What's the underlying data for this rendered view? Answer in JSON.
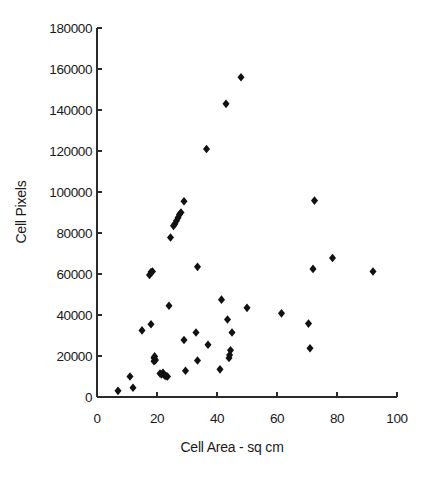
{
  "chart_data": {
    "type": "scatter",
    "title": "",
    "xlabel": "Cell Area - sq cm",
    "ylabel": "Cell Pixels",
    "xlim": [
      0,
      100
    ],
    "ylim": [
      0,
      180000
    ],
    "xticks": [
      0,
      20,
      40,
      60,
      80,
      100
    ],
    "xtick_labels": [
      "0",
      "20",
      "40",
      "60",
      "80",
      "100"
    ],
    "yticks": [
      0,
      20000,
      40000,
      60000,
      80000,
      100000,
      120000,
      140000,
      160000,
      180000
    ],
    "ytick_labels": [
      "0",
      "20000",
      "40000",
      "60000",
      "80000",
      "100000",
      "120000",
      "140000",
      "160000",
      "180000"
    ],
    "grid": false,
    "legend": false,
    "marker": "diamond",
    "marker_color": "#111111",
    "series": [
      {
        "name": "Cell Pixels vs Cell Area",
        "points": [
          [
            7,
            3000
          ],
          [
            11,
            10000
          ],
          [
            12,
            4500
          ],
          [
            15,
            32500
          ],
          [
            17.5,
            59500
          ],
          [
            18,
            61000
          ],
          [
            18.5,
            61200
          ],
          [
            18,
            35500
          ],
          [
            19,
            17500
          ],
          [
            19,
            19000
          ],
          [
            19.2,
            19800
          ],
          [
            19.5,
            18000
          ],
          [
            21,
            11500
          ],
          [
            21.5,
            11000
          ],
          [
            22,
            11800
          ],
          [
            22.5,
            10500
          ],
          [
            23,
            10200
          ],
          [
            23.5,
            10000
          ],
          [
            24,
            44500
          ],
          [
            24.5,
            77800
          ],
          [
            25.5,
            83500
          ],
          [
            26,
            84500
          ],
          [
            26.5,
            86000
          ],
          [
            27,
            87500
          ],
          [
            27.5,
            89000
          ],
          [
            28,
            90000
          ],
          [
            29,
            95500
          ],
          [
            29,
            27800
          ],
          [
            29.5,
            12800
          ],
          [
            33,
            31500
          ],
          [
            33.5,
            63500
          ],
          [
            33.5,
            17800
          ],
          [
            37,
            25500
          ],
          [
            36.5,
            121000
          ],
          [
            41,
            13500
          ],
          [
            41.5,
            47500
          ],
          [
            43,
            143000
          ],
          [
            43.5,
            37800
          ],
          [
            44,
            19000
          ],
          [
            44.2,
            20500
          ],
          [
            44.5,
            22800
          ],
          [
            45,
            31500
          ],
          [
            48,
            156000
          ],
          [
            50,
            43500
          ],
          [
            61.5,
            40800
          ],
          [
            70.5,
            35800
          ],
          [
            71,
            23800
          ],
          [
            72,
            62500
          ],
          [
            72.5,
            95800
          ],
          [
            78.5,
            67800
          ],
          [
            92,
            61200
          ]
        ]
      }
    ]
  }
}
